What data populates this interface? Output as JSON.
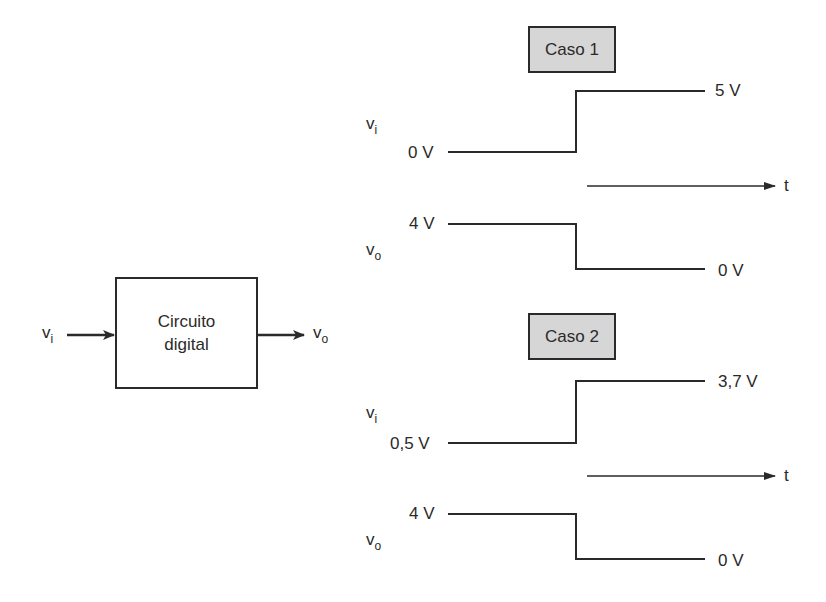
{
  "block": {
    "line1": "Circuito",
    "line2": "digital",
    "input_label": {
      "base": "v",
      "sub": "i"
    },
    "output_label": {
      "base": "v",
      "sub": "o"
    }
  },
  "cases": [
    {
      "title": "Caso 1",
      "vi": {
        "label": {
          "base": "v",
          "sub": "i"
        },
        "low": "0 V",
        "high": "5 V"
      },
      "vo": {
        "label": {
          "base": "v",
          "sub": "o"
        },
        "high": "4 V",
        "low": "0 V"
      },
      "time_label": "t"
    },
    {
      "title": "Caso 2",
      "vi": {
        "label": {
          "base": "v",
          "sub": "i"
        },
        "low": "0,5 V",
        "high": "3,7 V"
      },
      "vo": {
        "label": {
          "base": "v",
          "sub": "o"
        },
        "high": "4 V",
        "low": "0 V"
      },
      "time_label": "t"
    }
  ],
  "colors": {
    "line": "#2a2a2a",
    "case_fill": "#d6d6d6"
  }
}
